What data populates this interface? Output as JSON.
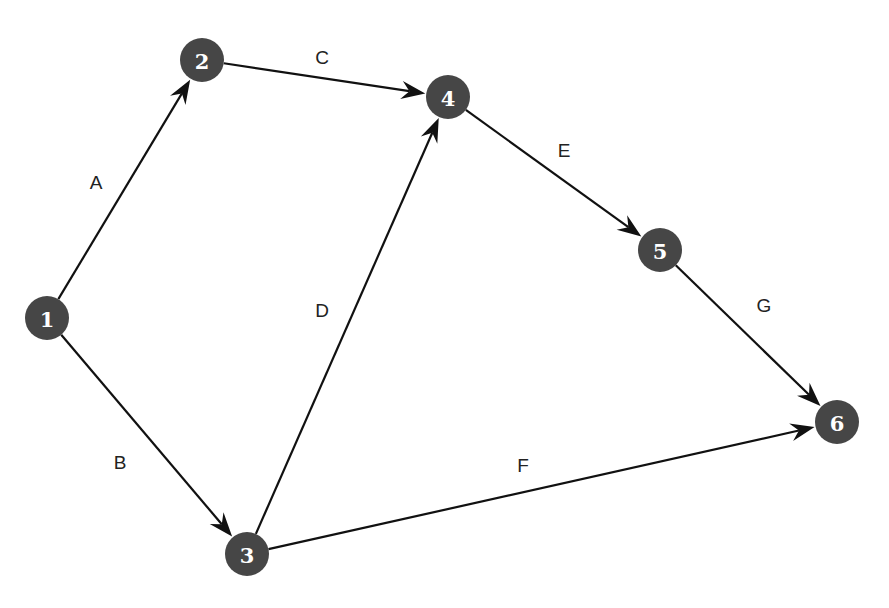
{
  "diagram": {
    "type": "directed-network",
    "colors": {
      "node_fill": "#464646",
      "node_text": "#ffffff",
      "edge": "#111111",
      "edge_label": "#222222",
      "background": "#ffffff"
    },
    "node_radius": 22,
    "nodes": [
      {
        "id": "1",
        "label": "1",
        "x": 47,
        "y": 318
      },
      {
        "id": "2",
        "label": "2",
        "x": 202,
        "y": 60
      },
      {
        "id": "3",
        "label": "3",
        "x": 247,
        "y": 554
      },
      {
        "id": "4",
        "label": "4",
        "x": 448,
        "y": 97
      },
      {
        "id": "5",
        "label": "5",
        "x": 660,
        "y": 250
      },
      {
        "id": "6",
        "label": "6",
        "x": 837,
        "y": 422
      }
    ],
    "edges": [
      {
        "label": "A",
        "from": "1",
        "to": "2",
        "label_x": 96,
        "label_y": 182
      },
      {
        "label": "B",
        "from": "1",
        "to": "3",
        "label_x": 120,
        "label_y": 462
      },
      {
        "label": "C",
        "from": "2",
        "to": "4",
        "label_x": 322,
        "label_y": 57
      },
      {
        "label": "D",
        "from": "3",
        "to": "4",
        "label_x": 322,
        "label_y": 310
      },
      {
        "label": "E",
        "from": "4",
        "to": "5",
        "label_x": 564,
        "label_y": 150
      },
      {
        "label": "F",
        "from": "3",
        "to": "6",
        "label_x": 523,
        "label_y": 465
      },
      {
        "label": "G",
        "from": "5",
        "to": "6",
        "label_x": 764,
        "label_y": 305
      }
    ]
  }
}
